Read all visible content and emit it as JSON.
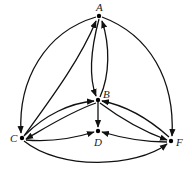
{
  "diagram": {
    "type": "directed-graph",
    "nodes": [
      {
        "id": "A",
        "label": "A",
        "x": 99,
        "y": 16
      },
      {
        "id": "B",
        "label": "B",
        "x": 98,
        "y": 100
      },
      {
        "id": "C",
        "label": "C",
        "x": 22,
        "y": 138
      },
      {
        "id": "D",
        "label": "D",
        "x": 98,
        "y": 131
      },
      {
        "id": "F",
        "label": "F",
        "x": 171,
        "y": 141
      }
    ],
    "edges": [
      {
        "from": "A",
        "to": "C"
      },
      {
        "from": "C",
        "to": "A"
      },
      {
        "from": "A",
        "to": "B"
      },
      {
        "from": "B",
        "to": "A"
      },
      {
        "from": "A",
        "to": "F"
      },
      {
        "from": "C",
        "to": "B"
      },
      {
        "from": "B",
        "to": "C"
      },
      {
        "from": "B",
        "to": "D"
      },
      {
        "from": "B",
        "to": "F"
      },
      {
        "from": "F",
        "to": "B"
      },
      {
        "from": "C",
        "to": "D"
      },
      {
        "from": "F",
        "to": "D"
      },
      {
        "from": "C",
        "to": "F"
      }
    ],
    "colors": {
      "stroke": "#111111",
      "background": "#ffffff"
    }
  }
}
